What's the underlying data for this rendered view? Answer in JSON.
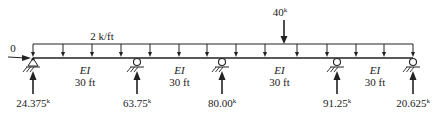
{
  "diagram": {
    "distributed_load": {
      "label": "2 k/ft"
    },
    "point_load": {
      "value": "40",
      "unit": "k"
    },
    "horizontal_reaction": {
      "label": "0"
    },
    "spans": [
      {
        "stiffness": "EI",
        "length": "30 ft"
      },
      {
        "stiffness": "EI",
        "length": "30 ft"
      },
      {
        "stiffness": "EI",
        "length": "30 ft"
      },
      {
        "stiffness": "EI",
        "length": "30 ft"
      }
    ],
    "supports": [
      {
        "type": "pin",
        "reaction": "24.375",
        "unit": "k"
      },
      {
        "type": "roller",
        "reaction": "63.75",
        "unit": "k"
      },
      {
        "type": "roller",
        "reaction": "80.00",
        "unit": "k"
      },
      {
        "type": "roller",
        "reaction": "91.25",
        "unit": "k"
      },
      {
        "type": "roller",
        "reaction": "20.625",
        "unit": "k"
      }
    ]
  }
}
